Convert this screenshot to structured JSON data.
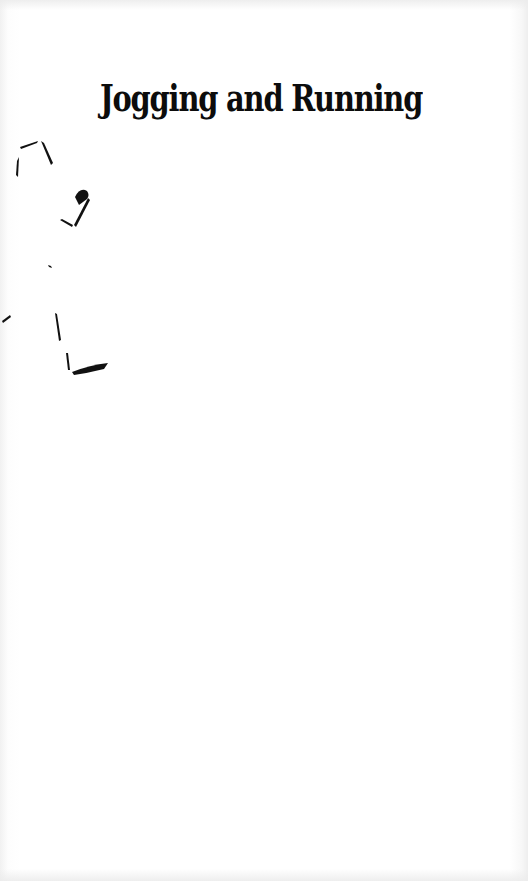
{
  "document": {
    "title": "Jogging and Running",
    "illustration": "running-figure-icon",
    "colors": {
      "background": "#ffffff",
      "ink": "#0c0c0c"
    }
  }
}
